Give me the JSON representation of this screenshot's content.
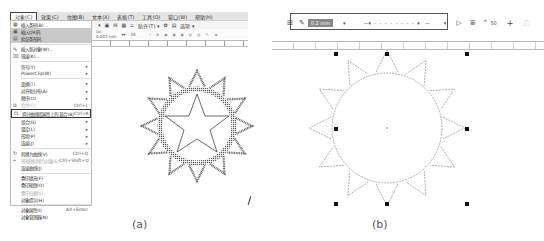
{
  "panel_a": {
    "caption": "(a)",
    "menubar": [
      "对象(C)",
      "效果(C)",
      "位图(B)",
      "文本(X)",
      "表格(T)",
      "工具(O)",
      "窗口(W)",
      "帮助(H)"
    ],
    "active_menu": "对象(C)",
    "toolbar": {
      "snap_label": "贴齐(T) ▾",
      "zoom_label": "选项 ▾"
    },
    "propbar": {
      "x_label": "(x)",
      "x_value": "0.001 mm",
      "y_label": "44"
    },
    "menu_items": [
      {
        "icon": "▦",
        "label": "插入条码(B)...",
        "state": "normal"
      },
      {
        "icon": "▣",
        "label": "插入QR码",
        "state": "highlight"
      },
      {
        "icon": "▤",
        "label": "验证条形码",
        "state": "highlight"
      },
      {
        "sep": true
      },
      {
        "icon": "✎",
        "label": "插入新对象(W)...",
        "state": "normal"
      },
      {
        "icon": "⌧",
        "label": "链接(K)...",
        "state": "normal"
      },
      {
        "sep": true
      },
      {
        "label": "符号(Y)",
        "state": "normal",
        "submenu": true
      },
      {
        "label": "PowerClip(W)",
        "state": "normal",
        "submenu": true
      },
      {
        "sep": true
      },
      {
        "label": "变换(T)",
        "state": "normal",
        "submenu": true
      },
      {
        "label": "对齐和分布(A)",
        "state": "normal",
        "submenu": true
      },
      {
        "label": "顺序(O)",
        "state": "normal",
        "submenu": true
      },
      {
        "icon": "⧉",
        "label": "合并(C)",
        "state": "disabled",
        "shortcut": "Ctrl+L"
      },
      {
        "icon": "⊡",
        "label": "拆分曲线段属性上的 混合(B)",
        "state": "selected",
        "shortcut": "Ctrl+K"
      },
      {
        "label": "组合(G)",
        "state": "normal",
        "submenu": true
      },
      {
        "label": "锁定(L)",
        "state": "normal",
        "submenu": true
      },
      {
        "label": "形状(P)",
        "state": "normal",
        "submenu": true
      },
      {
        "label": "连接(J)",
        "state": "normal",
        "submenu": true
      },
      {
        "sep": true
      },
      {
        "icon": "↻",
        "label": "转换为曲线(V)",
        "shortcut": "Ctrl+Q",
        "state": "normal"
      },
      {
        "icon": "⌁",
        "label": "将轮廓转换为对象(E)",
        "shortcut": "Ctrl+Shift+Q",
        "state": "disabled"
      },
      {
        "label": "连接曲线(J)",
        "state": "normal"
      },
      {
        "sep": true
      },
      {
        "label": "叠印填充(F)",
        "state": "normal"
      },
      {
        "label": "叠印轮廓(O)",
        "state": "normal"
      },
      {
        "label": "叠印位图(V)",
        "state": "disabled"
      },
      {
        "label": "对象提示(H)",
        "state": "normal"
      },
      {
        "sep": true
      },
      {
        "label": "对象属性(I)",
        "shortcut": "Alt+Enter",
        "state": "normal"
      },
      {
        "label": "对象管理器(N)",
        "state": "normal"
      }
    ]
  },
  "panel_b": {
    "caption": "(b)",
    "toolbar": {
      "outline_width": "0.2 mm",
      "miter_value": "50",
      "plus_label": "+"
    }
  }
}
